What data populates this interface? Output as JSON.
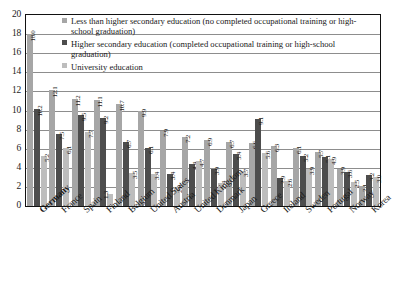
{
  "chart_data": {
    "type": "bar",
    "title": "",
    "xlabel": "",
    "ylabel": "",
    "ylim": [
      0,
      20
    ],
    "ytick_step": 2,
    "yticks": [
      "20",
      "18",
      "16",
      "14",
      "12",
      "10",
      "8",
      "6",
      "4",
      "2",
      "0"
    ],
    "grid": true,
    "legend_position": "top-right-inside",
    "categories": [
      "Germany",
      "France",
      "Spain",
      "Finland",
      "Belgium",
      "United States",
      "Austria",
      "United Kingdom",
      "Denmark",
      "Japan",
      "Greece",
      "Ireland",
      "Sweden",
      "Portugal",
      "Norway",
      "Korea"
    ],
    "highlighted_category": "Germany",
    "series": [
      {
        "name": "Less than higher secondary education (no completed occupational training or high-school graduation)",
        "color": "#a6a6a6",
        "values": [
          18.0,
          12.1,
          11.2,
          11.1,
          10.7,
          9.9,
          7.9,
          7.2,
          6.9,
          6.7,
          6.6,
          6.3,
          6.1,
          5.7,
          3.9,
          2.1
        ],
        "labels": [
          "18.0",
          "12.1",
          "11.2",
          "11.1",
          "10.7",
          "9.9",
          "7.9",
          "7.2",
          "6.9",
          "6.7",
          "6.6",
          "6.3",
          "6.1",
          "5.7",
          "3.9",
          "2.1"
        ]
      },
      {
        "name": "Higher secondary education (completed occupational training or high-school graduation)",
        "color": "#4d4d4d",
        "values": [
          10.2,
          7.5,
          9.5,
          9.2,
          6.7,
          6.1,
          3.4,
          4.4,
          3.9,
          5.4,
          9.1,
          2.9,
          5.2,
          5.1,
          3.6,
          3.2
        ],
        "labels": [
          "10.2",
          "7.5",
          "9.5",
          "9.2",
          "6.7",
          "6.1",
          "3.4",
          "4.4",
          "3.9",
          "5.4",
          "9.1",
          "2.9",
          "5.2",
          "5.1",
          "3.6",
          "3.2"
        ]
      },
      {
        "name": "University education",
        "color": "#bdbdbd",
        "values": [
          5.2,
          6.1,
          7.7,
          1.3,
          3.5,
          3.4,
          2.0,
          4.7,
          2.4,
          3.7,
          5.6,
          2.6,
          3.9,
          4.9,
          2.5,
          3.0
        ],
        "labels": [
          "5.2",
          "6.1",
          "7.7",
          "1.3",
          "3.5",
          "3.4",
          "2.0",
          "4.7",
          "2.4",
          "3.7",
          "5.6",
          "2.6",
          "3.9",
          "4.9",
          "2.5",
          "3.0"
        ]
      }
    ]
  },
  "legend": {
    "entries": [
      "Less than higher secondary education (no completed occupational training or high-school graduation)",
      "Higher secondary education (completed occupational training or high-school graduation)",
      "University education"
    ]
  },
  "colors": {
    "series_1": "#a6a6a6",
    "series_2": "#4d4d4d",
    "series_3": "#bdbdbd",
    "grid": "#8d8d8d",
    "axis": "#111111",
    "text": "#1a1a1a"
  }
}
